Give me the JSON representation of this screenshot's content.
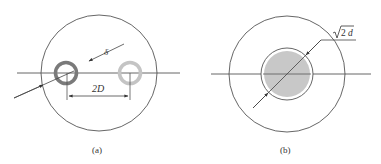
{
  "figure": {
    "panels": [
      {
        "id": "a",
        "caption": "(a)",
        "dimension_labels": {
          "gap": "δ",
          "spacing": "2D"
        },
        "elements": [
          "outer circle",
          "horizontal center line",
          "dark ring (conductor)",
          "light ring (conductor)",
          "diagonal dimension arrow",
          "spacing dimension arrow"
        ]
      },
      {
        "id": "b",
        "caption": "(b)",
        "dimension_labels": {
          "diameter_radical": "2",
          "diameter_var": "d",
          "diameter_full": "√2d"
        },
        "elements": [
          "outer circle",
          "horizontal center line",
          "shaded inner disc",
          "inner circle outline",
          "diagonal diameter dimension arrow with leader"
        ]
      }
    ],
    "colors": {
      "line": "#444444",
      "dark_ring": "#7a7a7a",
      "light_ring": "#c4c4c4",
      "fill": "#c8c8c8"
    }
  }
}
